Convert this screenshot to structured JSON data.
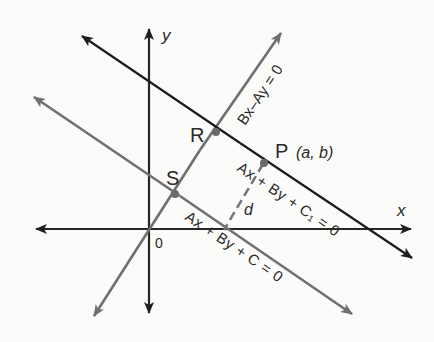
{
  "figure": {
    "axes": {
      "x_label": "x",
      "y_label": "y",
      "origin_label": "0"
    },
    "lines": {
      "perpendicular": {
        "equation": "Bx–Ay = 0",
        "color": "#6f6f6f"
      },
      "line_c1": {
        "equation_parts": [
          "Ax",
          "+",
          "By",
          "+",
          "C₁",
          "=",
          "0"
        ],
        "equation": "Ax + By + C₁ = 0",
        "color": "#1c1c1c"
      },
      "line_c": {
        "equation_parts": [
          "Ax",
          "+",
          "By",
          "+",
          "C",
          "=",
          "0"
        ],
        "equation": "Ax + By + C = 0",
        "color": "#707070"
      }
    },
    "points": {
      "R": {
        "label": "R"
      },
      "S": {
        "label": "S"
      },
      "P": {
        "label": "P",
        "coords_label": "(a, b)"
      }
    },
    "distance_label": "d",
    "colors": {
      "axis": "#262626",
      "point": "#6a6a6a",
      "background": "#fbfbf9"
    }
  }
}
